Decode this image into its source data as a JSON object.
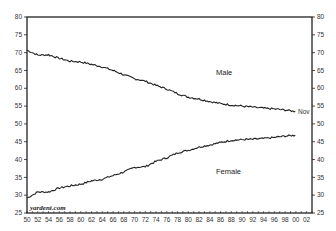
{
  "chart_data": {
    "type": "line",
    "title": "",
    "xlabel": "",
    "ylabel": "",
    "ylim": [
      25,
      80
    ],
    "xlim": [
      1950,
      2003
    ],
    "y_ticks": [
      25,
      30,
      35,
      40,
      45,
      50,
      55,
      60,
      65,
      70,
      75,
      80
    ],
    "x_tick_labels": [
      "50",
      "52",
      "54",
      "56",
      "58",
      "60",
      "62",
      "64",
      "66",
      "68",
      "70",
      "72",
      "74",
      "76",
      "78",
      "80",
      "82",
      "84",
      "86",
      "88",
      "90",
      "92",
      "94",
      "96",
      "98",
      "00",
      "02"
    ],
    "grid": false,
    "legend": "inline labels",
    "annotations": [
      {
        "text": "Male",
        "near_year": 1985,
        "y": 66
      },
      {
        "text": "Female",
        "near_year": 1985,
        "y": 37
      },
      {
        "text": "Nov",
        "near_year": 2000,
        "y": 53.5
      },
      {
        "text": "yardeni.com",
        "position": "bottom-left"
      }
    ],
    "x": [
      1950,
      1952,
      1954,
      1956,
      1958,
      1960,
      1962,
      1964,
      1966,
      1968,
      1970,
      1972,
      1974,
      1976,
      1978,
      1980,
      1982,
      1984,
      1986,
      1988,
      1990,
      1992,
      1994,
      1996,
      1998,
      1999.9
    ],
    "series": [
      {
        "name": "Male",
        "values": [
          70.7,
          69.3,
          69.4,
          68.4,
          67.6,
          67.4,
          66.7,
          66.0,
          65.0,
          63.8,
          62.7,
          62.0,
          60.8,
          59.8,
          58.5,
          57.5,
          57.0,
          56.3,
          55.7,
          55.3,
          55.0,
          54.7,
          54.4,
          54.2,
          53.9,
          53.5
        ]
      },
      {
        "name": "Female",
        "values": [
          29.2,
          30.9,
          30.9,
          32.0,
          32.6,
          33.1,
          34.0,
          34.5,
          35.5,
          36.5,
          37.8,
          38.0,
          39.5,
          40.5,
          41.9,
          42.6,
          43.5,
          44.1,
          44.8,
          45.4,
          45.6,
          45.7,
          45.9,
          46.2,
          46.6,
          46.8
        ]
      }
    ]
  },
  "labels": {
    "male": "Male",
    "female": "Female",
    "nov": "Nov",
    "watermark": "yardeni.com"
  }
}
